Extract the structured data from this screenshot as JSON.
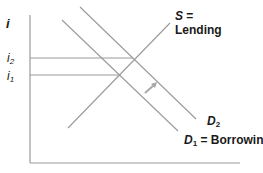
{
  "diagram": {
    "type": "supply-demand loanable funds",
    "y_axis_label": "i",
    "rate_labels": [
      {
        "base": "i",
        "sub": "2"
      },
      {
        "base": "i",
        "sub": "1"
      }
    ],
    "curves": {
      "supply": {
        "symbol": "S",
        "eq": " =",
        "name": "Lending"
      },
      "demand_new": {
        "symbol": "D",
        "sub": "2"
      },
      "demand_old": {
        "symbol": "D",
        "sub": "1",
        "name": " = Borrowing"
      }
    },
    "shift_arrow": "rightward shift from D1 to D2",
    "colors": {
      "lines": "#9a9a9a",
      "text": "#1a1a1a",
      "background": "#ffffff"
    }
  }
}
